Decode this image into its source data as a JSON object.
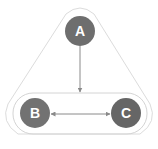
{
  "diagram": {
    "nodes": [
      {
        "id": "A",
        "label": "A",
        "cx": 80,
        "cy": 31,
        "r": 15,
        "color": "#6e6e6e"
      },
      {
        "id": "B",
        "label": "B",
        "cx": 35,
        "cy": 113,
        "r": 15,
        "color": "#727272"
      },
      {
        "id": "C",
        "label": "C",
        "cx": 126,
        "cy": 113,
        "r": 15,
        "color": "#666666"
      }
    ],
    "edges": [
      {
        "from": "A",
        "to": "BC-group",
        "type": "directed"
      },
      {
        "from": "B",
        "to": "C",
        "type": "bidirectional"
      }
    ],
    "groups": [
      {
        "id": "outer",
        "shape": "rounded-triangle",
        "contains": [
          "A",
          "B",
          "C"
        ]
      },
      {
        "id": "BC-group",
        "shape": "rounded-rectangle",
        "contains": [
          "B",
          "C"
        ]
      }
    ],
    "colors": {
      "outline": "#d6d6d6",
      "arrow": "#8a8a8a",
      "label": "#ffffff"
    }
  }
}
